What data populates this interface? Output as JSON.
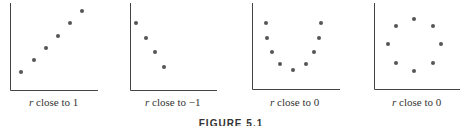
{
  "chart_data": [
    {
      "type": "scatter",
      "title": "",
      "label_var": "r",
      "label_text": "close to 1",
      "xlabel": "",
      "ylabel": "",
      "grid": false,
      "axis": {
        "x0": 10,
        "y0": 90,
        "x1": 98,
        "ytop": 3
      },
      "points": [
        [
          21,
          72
        ],
        [
          34,
          60
        ],
        [
          46,
          48
        ],
        [
          58,
          36
        ],
        [
          70,
          23
        ],
        [
          82,
          11
        ]
      ]
    },
    {
      "type": "scatter",
      "title": "",
      "label_var": "r",
      "label_text": "close to −1",
      "xlabel": "",
      "ylabel": "",
      "grid": false,
      "axis": {
        "x0": 130,
        "y0": 90,
        "x1": 217,
        "ytop": 3
      },
      "points": [
        [
          136,
          23
        ],
        [
          146,
          38
        ],
        [
          155,
          52
        ],
        [
          164,
          67
        ]
      ]
    },
    {
      "type": "scatter",
      "title": "",
      "label_var": "r",
      "label_text": "close to 0",
      "xlabel": "",
      "ylabel": "",
      "grid": false,
      "axis": {
        "x0": 252,
        "y0": 89,
        "x1": 340,
        "ytop": 3
      },
      "points": [
        [
          266,
          23
        ],
        [
          267,
          38
        ],
        [
          272,
          52
        ],
        [
          280,
          64
        ],
        [
          293,
          70
        ],
        [
          306,
          64
        ],
        [
          314,
          52
        ],
        [
          319,
          38
        ],
        [
          321,
          23
        ]
      ]
    },
    {
      "type": "scatter",
      "title": "",
      "label_var": "r",
      "label_text": "close to 0",
      "xlabel": "",
      "ylabel": "",
      "grid": false,
      "axis": {
        "x0": 374,
        "y0": 89,
        "x1": 460,
        "ytop": 3
      },
      "points": [
        [
          414,
          19
        ],
        [
          396,
          26
        ],
        [
          433,
          26
        ],
        [
          388,
          44
        ],
        [
          441,
          44
        ],
        [
          396,
          63
        ],
        [
          433,
          63
        ],
        [
          414,
          71
        ]
      ]
    }
  ],
  "panels": [
    {
      "var": "r",
      "text": " close to 1"
    },
    {
      "var": "r",
      "text": " close to −1"
    },
    {
      "var": "r",
      "text": " close to 0"
    },
    {
      "var": "r",
      "text": " close to 0"
    }
  ],
  "caption": "FIGURE 5.1"
}
